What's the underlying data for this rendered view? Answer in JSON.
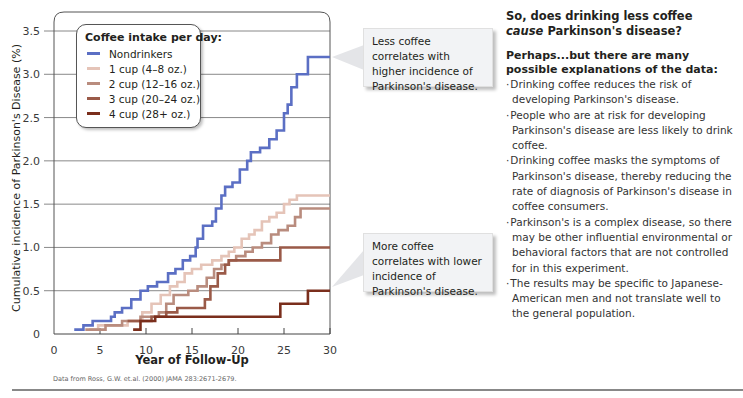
{
  "chart_data": {
    "type": "line",
    "step": true,
    "title": "",
    "xlabel": "Year of Follow-Up",
    "ylabel": "Cumulative incidence of Parkinson's Disease (%)",
    "xlim": [
      0,
      30
    ],
    "ylim": [
      0,
      3.5
    ],
    "xticks": [
      "0",
      "5",
      "10",
      "15",
      "20",
      "25",
      "30"
    ],
    "yticks": [
      "0",
      "0.5",
      "1.0",
      "1.5",
      "2.0",
      "2.5",
      "3.0",
      "3.5"
    ],
    "grid": "horizontal",
    "legend": {
      "title": "Coffee intake per day:",
      "position": "upper-left",
      "entries": [
        "Nondrinkers",
        "1 cup (4–8 oz.)",
        "2 cup (12–16 oz.)",
        "3 cup (20–24 oz.)",
        "4 cup (28+ oz.)"
      ]
    },
    "series": [
      {
        "name": "Nondrinkers",
        "color": "#5b6fc4",
        "x": [
          2.2,
          3.2,
          4.2,
          6.2,
          6.6,
          7.4,
          8.4,
          9.4,
          10.2,
          11.2,
          12.4,
          13.2,
          14.0,
          14.8,
          15.4,
          15.6,
          16.2,
          17.2,
          17.6,
          18.2,
          18.6,
          19.4,
          20.2,
          21.0,
          21.4,
          22.4,
          23.4,
          24.2,
          25.0,
          25.4,
          25.8,
          26.4,
          27.6,
          30.0
        ],
        "y": [
          0.05,
          0.1,
          0.15,
          0.2,
          0.25,
          0.3,
          0.4,
          0.5,
          0.55,
          0.6,
          0.7,
          0.75,
          0.85,
          0.9,
          1.0,
          1.1,
          1.25,
          1.3,
          1.45,
          1.6,
          1.7,
          1.75,
          1.9,
          2.0,
          2.1,
          2.15,
          2.25,
          2.35,
          2.55,
          2.65,
          2.85,
          3.0,
          3.2,
          3.2
        ]
      },
      {
        "name": "1 cup (4–8 oz.)",
        "color": "#e5c4b8",
        "x": [
          3.8,
          4.8,
          8.0,
          9.6,
          10.6,
          11.6,
          12.6,
          13.4,
          14.2,
          15.0,
          16.0,
          17.2,
          18.2,
          19.0,
          19.6,
          20.4,
          21.2,
          21.8,
          22.6,
          23.4,
          24.2,
          25.0,
          25.6,
          26.4,
          27.6,
          30.0
        ],
        "y": [
          0.05,
          0.1,
          0.15,
          0.25,
          0.35,
          0.45,
          0.55,
          0.6,
          0.7,
          0.75,
          0.8,
          0.85,
          0.9,
          0.95,
          1.0,
          1.1,
          1.15,
          1.2,
          1.3,
          1.35,
          1.4,
          1.5,
          1.55,
          1.6,
          1.6,
          1.6
        ]
      },
      {
        "name": "2 cup (12–16 oz.)",
        "color": "#b98c7e",
        "x": [
          3.4,
          5.6,
          7.4,
          9.4,
          11.4,
          12.2,
          13.0,
          14.6,
          15.6,
          16.6,
          17.4,
          18.2,
          19.0,
          19.8,
          20.8,
          21.6,
          22.6,
          23.6,
          24.4,
          25.4,
          26.2,
          26.8,
          27.6,
          30.0
        ],
        "y": [
          0.05,
          0.1,
          0.15,
          0.2,
          0.25,
          0.35,
          0.45,
          0.5,
          0.55,
          0.65,
          0.75,
          0.8,
          0.85,
          0.9,
          0.95,
          1.0,
          1.05,
          1.15,
          1.2,
          1.25,
          1.35,
          1.45,
          1.45,
          1.45
        ]
      },
      {
        "name": "3 cup (20–24 oz.)",
        "color": "#9a5a48",
        "x": [
          8.0,
          10.6,
          12.2,
          13.4,
          16.4,
          17.0,
          17.8,
          18.6,
          19.0,
          20.8,
          24.6,
          27.6,
          30.0
        ],
        "y": [
          0.15,
          0.2,
          0.25,
          0.3,
          0.4,
          0.55,
          0.7,
          0.8,
          0.85,
          0.85,
          1.0,
          1.0,
          1.0
        ]
      },
      {
        "name": "4 cup (28+ oz.)",
        "color": "#7a2e1c",
        "x": [
          8.6,
          9.4,
          11.0,
          24.0,
          24.6,
          27.6,
          30.0
        ],
        "y": [
          0.05,
          0.15,
          0.2,
          0.2,
          0.35,
          0.5,
          0.5
        ]
      }
    ],
    "annotations": [
      {
        "text": "Less coffee correlates with higher incidence of Parkinson's disease.",
        "points_to": "Nondrinkers at x=30"
      },
      {
        "text": "More coffee correlates with lower incidence of Parkinson's disease.",
        "points_to": "4 cup at x=30"
      }
    ]
  },
  "legend": {
    "title": "Coffee intake per day:",
    "items": [
      {
        "label": "Nondrinkers",
        "color": "#5b6fc4"
      },
      {
        "label": "1 cup (4–8 oz.)",
        "color": "#e5c4b8"
      },
      {
        "label": "2 cup (12–16 oz.)",
        "color": "#b98c7e"
      },
      {
        "label": "3 cup (20–24 oz.)",
        "color": "#9a5a48"
      },
      {
        "label": "4 cup (28+ oz.)",
        "color": "#7a2e1c"
      }
    ]
  },
  "callouts": {
    "top": "Less coffee correlates with higher incidence of Parkinson's disease.",
    "bottom": "More coffee correlates with lower incidence of Parkinson's disease."
  },
  "source": "Data from Ross, G.W. et.al. (2000) JAMA 283:2671-2679.",
  "sidebar": {
    "question_line1": "So, does drinking less coffee",
    "question_italic": "cause",
    "question_line2_rest": " Parkinson's disease?",
    "subheading": "Perhaps...but there are many possible explanations of the data:",
    "items": [
      "Drinking coffee reduces the risk of developing Parkinson's disease.",
      "People who are at risk for developing Parkinson's disease are less likely to drink coffee.",
      "Drinking coffee masks the symptoms of Parkinson's disease, thereby reducing the rate of diagnosis of Parkinson's disease in coffee consumers.",
      "Parkinson's is a complex disease, so there may be other influential environmental or behavioral factors that are not controlled for in this experiment.",
      "The results may be specific to Japanese-American men and not translate well to the general population."
    ]
  }
}
